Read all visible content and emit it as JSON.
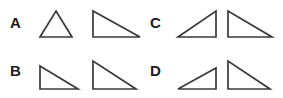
{
  "figure": {
    "background_color": "#ffffff",
    "stroke_color": "#3a3a3a",
    "label_color": "#1c1c1c",
    "width": 283,
    "height": 98
  },
  "options": [
    {
      "label": "A",
      "label_x": 10,
      "label_y": 28,
      "shapes": [
        {
          "name": "triangle-a-1",
          "kind": "isosceles-acute",
          "points": "56,11 72,37 40,37",
          "description": "isosceles triangle, apex at top center, horizontal base"
        },
        {
          "name": "triangle-a-2",
          "kind": "right-triangle",
          "points": "93,11 93,37 140,37",
          "description": "right triangle, right angle at bottom left, vertical left leg, long horizontal base"
        }
      ]
    },
    {
      "label": "B",
      "label_x": 10,
      "label_y": 76,
      "shapes": [
        {
          "name": "triangle-b-1",
          "kind": "right-triangle",
          "points": "40,66 40,89 78,89",
          "description": "right triangle, right angle at bottom left, short vertical left leg"
        },
        {
          "name": "triangle-b-2",
          "kind": "right-triangle",
          "points": "93,61 93,89 136,89",
          "description": "right triangle, right angle at bottom left, taller vertical left leg"
        }
      ]
    },
    {
      "label": "C",
      "label_x": 150,
      "label_y": 28,
      "shapes": [
        {
          "name": "triangle-c-1",
          "kind": "right-triangle",
          "points": "216,11 216,37 178,37",
          "description": "right triangle, right angle at bottom right, vertical right leg"
        },
        {
          "name": "triangle-c-2",
          "kind": "right-triangle",
          "points": "228,11 228,37 272,37",
          "description": "right triangle, right angle at bottom left, vertical left leg"
        }
      ]
    },
    {
      "label": "D",
      "label_x": 150,
      "label_y": 76,
      "shapes": [
        {
          "name": "triangle-d-1",
          "kind": "right-triangle",
          "points": "216,68 216,89 178,89",
          "description": "right triangle, right angle at bottom right, short vertical right leg"
        },
        {
          "name": "triangle-d-2",
          "kind": "right-triangle",
          "points": "228,61 228,89 270,89",
          "description": "right triangle, right angle at bottom left, tall vertical left leg"
        }
      ]
    }
  ]
}
